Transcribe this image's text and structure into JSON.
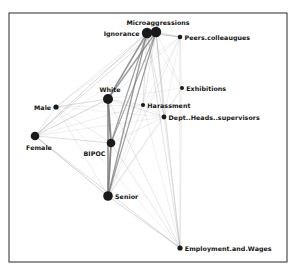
{
  "figure": {
    "type": "network-graph",
    "title": "",
    "background_color": "#ffffff",
    "frame": {
      "color": "#3c3c3c",
      "x": 9,
      "y": 13,
      "width": 278,
      "height": 249
    }
  },
  "chart_data": {
    "type": "network",
    "title": "",
    "xlabel": "",
    "ylabel": "",
    "node_color": "#1a1a1a",
    "edge_color": "#808080",
    "nodes": [
      {
        "id": "ignorance",
        "label": "Ignorance",
        "x": 147,
        "y": 33,
        "size": 5.2,
        "label_pos": "left"
      },
      {
        "id": "microaggressions",
        "label": "Microaggressions",
        "x": 156,
        "y": 32,
        "size": 5.2,
        "label_pos": "above"
      },
      {
        "id": "peers",
        "label": "Peers.colleaugues",
        "x": 180,
        "y": 37,
        "size": 2.3,
        "label_pos": "right"
      },
      {
        "id": "exhibitions",
        "label": "Exhibitions",
        "x": 182,
        "y": 88,
        "size": 2.0,
        "label_pos": "right"
      },
      {
        "id": "harassment",
        "label": "Harassment",
        "x": 143,
        "y": 105,
        "size": 2.1,
        "label_pos": "right"
      },
      {
        "id": "deptheads",
        "label": "Dept..Heads..supervisors",
        "x": 164,
        "y": 117,
        "size": 2.4,
        "label_pos": "right"
      },
      {
        "id": "white",
        "label": "White",
        "x": 108,
        "y": 99,
        "size": 5.0,
        "label_pos": "above"
      },
      {
        "id": "male",
        "label": "Male",
        "x": 56,
        "y": 107,
        "size": 2.6,
        "label_pos": "left"
      },
      {
        "id": "female",
        "label": "Female",
        "x": 35,
        "y": 136,
        "size": 4.3,
        "label_pos": "below"
      },
      {
        "id": "bipoc",
        "label": "BIPOC",
        "x": 111,
        "y": 143,
        "size": 4.3,
        "label_pos": "belowleft"
      },
      {
        "id": "senior",
        "label": "Senior",
        "x": 108,
        "y": 196,
        "size": 4.8,
        "label_pos": "right"
      },
      {
        "id": "employment",
        "label": "Employment.and.Wages",
        "x": 180,
        "y": 248,
        "size": 2.6,
        "label_pos": "right"
      }
    ],
    "edges": [
      {
        "source": "ignorance",
        "target": "microaggressions",
        "weight": 3.0
      },
      {
        "source": "ignorance",
        "target": "white",
        "weight": 2.4
      },
      {
        "source": "ignorance",
        "target": "bipoc",
        "weight": 2.0
      },
      {
        "source": "ignorance",
        "target": "senior",
        "weight": 2.2
      },
      {
        "source": "ignorance",
        "target": "female",
        "weight": 1.0
      },
      {
        "source": "ignorance",
        "target": "male",
        "weight": 0.7
      },
      {
        "source": "ignorance",
        "target": "peers",
        "weight": 1.2
      },
      {
        "source": "ignorance",
        "target": "harassment",
        "weight": 0.8
      },
      {
        "source": "ignorance",
        "target": "deptheads",
        "weight": 0.8
      },
      {
        "source": "ignorance",
        "target": "exhibitions",
        "weight": 0.5
      },
      {
        "source": "ignorance",
        "target": "employment",
        "weight": 0.8
      },
      {
        "source": "microaggressions",
        "target": "white",
        "weight": 2.2
      },
      {
        "source": "microaggressions",
        "target": "bipoc",
        "weight": 1.8
      },
      {
        "source": "microaggressions",
        "target": "senior",
        "weight": 2.0
      },
      {
        "source": "microaggressions",
        "target": "female",
        "weight": 0.9
      },
      {
        "source": "microaggressions",
        "target": "male",
        "weight": 0.6
      },
      {
        "source": "microaggressions",
        "target": "peers",
        "weight": 1.0
      },
      {
        "source": "microaggressions",
        "target": "harassment",
        "weight": 0.7
      },
      {
        "source": "microaggressions",
        "target": "deptheads",
        "weight": 0.9
      },
      {
        "source": "microaggressions",
        "target": "exhibitions",
        "weight": 0.5
      },
      {
        "source": "microaggressions",
        "target": "employment",
        "weight": 0.9
      },
      {
        "source": "white",
        "target": "bipoc",
        "weight": 3.2
      },
      {
        "source": "white",
        "target": "senior",
        "weight": 2.6
      },
      {
        "source": "white",
        "target": "female",
        "weight": 1.0
      },
      {
        "source": "white",
        "target": "male",
        "weight": 0.9
      },
      {
        "source": "white",
        "target": "harassment",
        "weight": 0.6
      },
      {
        "source": "white",
        "target": "deptheads",
        "weight": 0.7
      },
      {
        "source": "white",
        "target": "peers",
        "weight": 0.6
      },
      {
        "source": "white",
        "target": "exhibitions",
        "weight": 0.4
      },
      {
        "source": "white",
        "target": "employment",
        "weight": 0.7
      },
      {
        "source": "bipoc",
        "target": "senior",
        "weight": 3.0
      },
      {
        "source": "bipoc",
        "target": "female",
        "weight": 0.9
      },
      {
        "source": "bipoc",
        "target": "male",
        "weight": 0.6
      },
      {
        "source": "bipoc",
        "target": "harassment",
        "weight": 0.6
      },
      {
        "source": "bipoc",
        "target": "deptheads",
        "weight": 0.6
      },
      {
        "source": "bipoc",
        "target": "employment",
        "weight": 0.7
      },
      {
        "source": "senior",
        "target": "female",
        "weight": 1.1
      },
      {
        "source": "senior",
        "target": "male",
        "weight": 0.6
      },
      {
        "source": "senior",
        "target": "harassment",
        "weight": 0.6
      },
      {
        "source": "senior",
        "target": "deptheads",
        "weight": 0.7
      },
      {
        "source": "senior",
        "target": "peers",
        "weight": 0.6
      },
      {
        "source": "senior",
        "target": "exhibitions",
        "weight": 0.4
      },
      {
        "source": "senior",
        "target": "employment",
        "weight": 1.0
      },
      {
        "source": "female",
        "target": "male",
        "weight": 0.7
      },
      {
        "source": "female",
        "target": "harassment",
        "weight": 0.5
      },
      {
        "source": "female",
        "target": "deptheads",
        "weight": 0.5
      },
      {
        "source": "female",
        "target": "employment",
        "weight": 0.9
      },
      {
        "source": "male",
        "target": "harassment",
        "weight": 0.4
      },
      {
        "source": "male",
        "target": "deptheads",
        "weight": 0.4
      },
      {
        "source": "harassment",
        "target": "deptheads",
        "weight": 0.6
      },
      {
        "source": "harassment",
        "target": "employment",
        "weight": 0.5
      },
      {
        "source": "deptheads",
        "target": "employment",
        "weight": 0.6
      },
      {
        "source": "deptheads",
        "target": "peers",
        "weight": 0.5
      },
      {
        "source": "peers",
        "target": "employment",
        "weight": 0.7
      },
      {
        "source": "peers",
        "target": "exhibitions",
        "weight": 0.4
      },
      {
        "source": "exhibitions",
        "target": "employment",
        "weight": 0.5
      },
      {
        "source": "exhibitions",
        "target": "deptheads",
        "weight": 0.4
      },
      {
        "source": "harassment",
        "target": "peers",
        "weight": 0.4
      },
      {
        "source": "female",
        "target": "peers",
        "weight": 0.4
      },
      {
        "source": "male",
        "target": "employment",
        "weight": 0.4
      }
    ]
  }
}
